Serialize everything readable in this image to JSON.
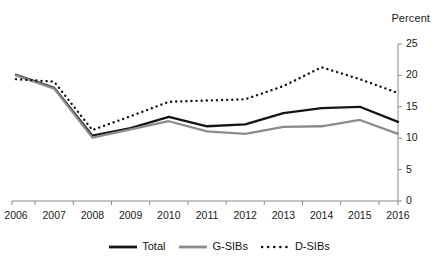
{
  "chart_data": {
    "type": "line",
    "title": "",
    "xlabel": "",
    "ylabel": "Percent",
    "unit_label": "Percent",
    "categories": [
      "2006",
      "2007",
      "2008",
      "2009",
      "2010",
      "2011",
      "2012",
      "2013",
      "2014",
      "2015",
      "2016"
    ],
    "x": [
      2006,
      2007,
      2008,
      2009,
      2010,
      2011,
      2012,
      2013,
      2014,
      2015,
      2016
    ],
    "ylim": [
      0,
      25
    ],
    "yticks": [
      0,
      5,
      10,
      15,
      20,
      25
    ],
    "ytick_labels": [
      "0",
      "5",
      "10",
      "15",
      "20",
      "25"
    ],
    "grid": false,
    "legend_position": "bottom-center",
    "y_axis_side": "right",
    "series": [
      {
        "name": "Total",
        "style": "solid",
        "color": "#151515",
        "values": [
          20.1,
          18.0,
          10.4,
          11.6,
          13.4,
          11.9,
          12.2,
          14.0,
          14.8,
          15.0,
          12.6
        ]
      },
      {
        "name": "G-SIBs",
        "style": "solid",
        "color": "#8c8c8c",
        "values": [
          20.0,
          17.9,
          10.1,
          11.4,
          12.7,
          11.1,
          10.7,
          11.8,
          11.9,
          12.9,
          10.7
        ]
      },
      {
        "name": "D-SIBs",
        "style": "dotted",
        "color": "#141414",
        "values": [
          19.4,
          19.0,
          11.3,
          13.5,
          15.8,
          16.0,
          16.2,
          18.3,
          21.3,
          19.4,
          17.2
        ]
      }
    ]
  },
  "legend": {
    "items": [
      {
        "label": "Total",
        "swatch": "solid-black-line-swatch"
      },
      {
        "label": "G-SIBs",
        "swatch": "solid-gray-line-swatch"
      },
      {
        "label": "D-SIBs",
        "swatch": "dotted-black-line-swatch"
      }
    ]
  },
  "colors": {
    "total": "#151515",
    "gsibs": "#8c8c8c",
    "dsibs": "#141414",
    "axis": "#8a8a8a",
    "background": "#ffffff"
  }
}
